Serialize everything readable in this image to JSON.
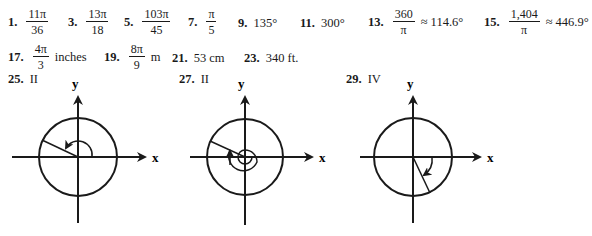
{
  "answers_row1": [
    {
      "number": "1.",
      "numerator": "11π",
      "denominator": "36",
      "suffix": ""
    },
    {
      "number": "3.",
      "numerator": "13π",
      "denominator": "18",
      "suffix": ""
    },
    {
      "number": "5.",
      "numerator": "103π",
      "denominator": "45",
      "suffix": ""
    },
    {
      "number": "7.",
      "numerator": "π",
      "denominator": "5",
      "suffix": ""
    },
    {
      "number": "9.",
      "value": "135°"
    },
    {
      "number": "11.",
      "value": "300°"
    },
    {
      "number": "13.",
      "numerator": "360",
      "denominator": "π",
      "suffix": "≈ 114.6°"
    },
    {
      "number": "15.",
      "numerator": "1,404",
      "denominator": "π",
      "suffix": "≈ 446.9°"
    }
  ],
  "answers_row2": [
    {
      "number": "17.",
      "numerator": "4π",
      "denominator": "3",
      "suffix": "inches"
    },
    {
      "number": "19.",
      "numerator": "8π",
      "denominator": "9",
      "suffix": "m"
    },
    {
      "number": "21.",
      "value": "53 cm"
    },
    {
      "number": "23.",
      "value": "340 ft."
    }
  ],
  "graphs": [
    {
      "number": "25.",
      "quadrant": "II",
      "x_label": "x",
      "y_label": "y"
    },
    {
      "number": "27.",
      "quadrant": "II",
      "x_label": "x",
      "y_label": "y"
    },
    {
      "number": "29.",
      "quadrant": "IV",
      "x_label": "x",
      "y_label": "y"
    }
  ]
}
